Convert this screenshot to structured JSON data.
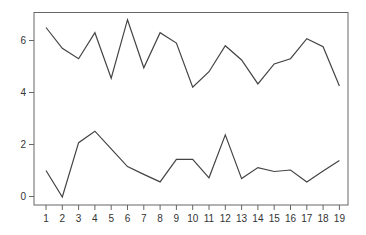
{
  "chart_data": {
    "type": "line",
    "title": "",
    "xlabel": "",
    "ylabel": "",
    "x": [
      1,
      2,
      3,
      4,
      5,
      6,
      7,
      8,
      9,
      10,
      11,
      12,
      13,
      14,
      15,
      16,
      17,
      18,
      19
    ],
    "x_tick_labels": [
      "1",
      "2",
      "3",
      "4",
      "5",
      "6",
      "7",
      "8",
      "9",
      "10",
      "11",
      "12",
      "13",
      "14",
      "15",
      "16",
      "17",
      "18",
      "19"
    ],
    "y_ticks": [
      0,
      2,
      4,
      6
    ],
    "y_tick_labels": [
      "0",
      "2",
      "4",
      "6"
    ],
    "xlim": [
      0.3,
      19.6
    ],
    "ylim": [
      -0.3,
      7.1
    ],
    "grid": false,
    "legend": null,
    "series": [
      {
        "name": "upper",
        "color": "#444444",
        "values": [
          6.5,
          5.7,
          5.3,
          6.3,
          4.55,
          6.8,
          4.95,
          6.3,
          5.9,
          4.2,
          4.8,
          5.8,
          5.25,
          4.33,
          5.1,
          5.3,
          6.07,
          5.76,
          4.25
        ]
      },
      {
        "name": "lower",
        "color": "#444444",
        "values": [
          1.0,
          -0.02,
          2.07,
          2.51,
          1.83,
          1.15,
          0.85,
          0.56,
          1.43,
          1.43,
          0.72,
          2.37,
          0.69,
          1.11,
          0.96,
          1.02,
          0.56,
          0.98,
          1.39
        ]
      }
    ]
  },
  "style": {
    "axis_color": "#666666",
    "line_color": "#444444",
    "background": "#ffffff"
  }
}
